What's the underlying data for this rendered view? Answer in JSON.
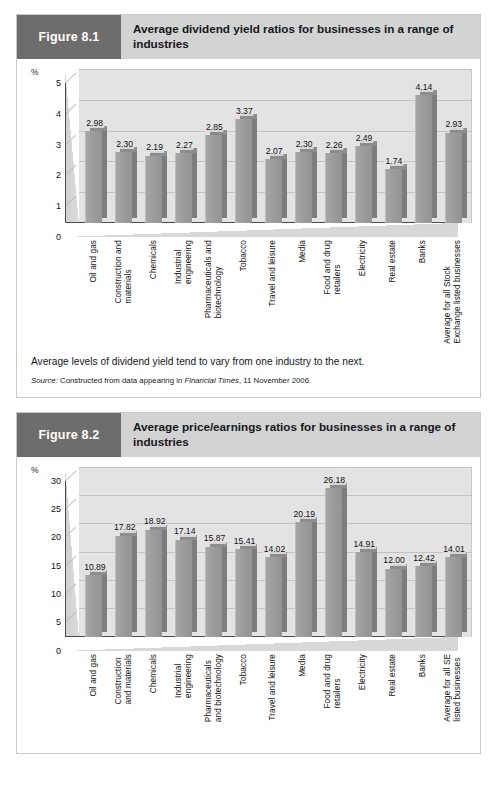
{
  "page": {
    "background": "#ffffff",
    "badge_color": "#6d6d6d",
    "header_color": "#d3d3d3",
    "bar_color": "#9a9a9a",
    "bar_side_color": "#7d7d7d",
    "plot_bg": "#e3e3e3"
  },
  "figures": [
    {
      "badge": "Figure 8.1",
      "title": "Average dividend yield ratios for businesses in a range of industries",
      "caption": "Average levels of dividend yield tend to vary from one industry to the next.",
      "source_prefix": "Source:",
      "source_text_1": " Constructed from data appearing in ",
      "source_italic": "Financial Times",
      "source_text_2": ", 11 November 2006.",
      "chart_data": {
        "type": "bar",
        "title": "Average dividend yield ratios for businesses in a range of industries",
        "xlabel": "",
        "ylabel": "%",
        "ylim": [
          0,
          5
        ],
        "yticks": [
          0,
          1,
          2,
          3,
          4,
          5
        ],
        "grid": true,
        "legend": "none",
        "categories": [
          "Oil and gas",
          "Construction and materials",
          "Chemicals",
          "Industrial engineering",
          "Pharmaceuticals and biotechnology",
          "Tobacco",
          "Travel and leisure",
          "Media",
          "Food and drug retailers",
          "Electricity",
          "Real estate",
          "Banks",
          "Average for all Stock Exchange listed businesses"
        ],
        "category_lines": [
          [
            "Oil and gas"
          ],
          [
            "Construction and",
            "materials"
          ],
          [
            "Chemicals"
          ],
          [
            "Industrial",
            "engineering"
          ],
          [
            "Pharmaceuticals and",
            "biotechnology"
          ],
          [
            "Tobacco"
          ],
          [
            "Travel and leisure"
          ],
          [
            "Media"
          ],
          [
            "Food and drug",
            "retailers"
          ],
          [
            "Electricity"
          ],
          [
            "Real estate"
          ],
          [
            "Banks"
          ],
          [
            "Average for all Stock",
            "Exchange listed businesses"
          ]
        ],
        "values": [
          2.98,
          2.3,
          2.19,
          2.27,
          2.85,
          3.37,
          2.07,
          2.3,
          2.26,
          2.49,
          1.74,
          4.14,
          2.93
        ],
        "value_labels": [
          "2.98",
          "2.30",
          "2.19",
          "2.27",
          "2.85",
          "3.37",
          "2.07",
          "2.30",
          "2.26",
          "2.49",
          "1.74",
          "4.14",
          "2.93"
        ]
      }
    },
    {
      "badge": "Figure 8.2",
      "title": "Average price/earnings ratios for businesses in a range of industries",
      "caption": "",
      "source_prefix": "",
      "source_text_1": "",
      "source_italic": "",
      "source_text_2": "",
      "chart_data": {
        "type": "bar",
        "title": "Average price/earnings ratios for businesses in a range of industries",
        "xlabel": "",
        "ylabel": "%",
        "ylim": [
          0,
          30
        ],
        "yticks": [
          0,
          5,
          10,
          15,
          20,
          25,
          30
        ],
        "grid": true,
        "legend": "none",
        "categories": [
          "Oil and gas",
          "Construction and materials",
          "Chemicals",
          "Industrial engineering",
          "Pharmaceuticals and biotechnology",
          "Tobacco",
          "Travel and leisure",
          "Media",
          "Food and drug retailers",
          "Electricity",
          "Real estate",
          "Banks",
          "Average for all SE listed businesses"
        ],
        "category_lines": [
          [
            "Oil and gas"
          ],
          [
            "Construction",
            "and  materials"
          ],
          [
            "Chemicals"
          ],
          [
            "Industrial",
            "engineering"
          ],
          [
            "Pharmaceuticals",
            "and biotechnology"
          ],
          [
            "Tobacco"
          ],
          [
            "Travel and leisure"
          ],
          [
            "Media"
          ],
          [
            "Food and drug",
            "retailers"
          ],
          [
            "Electricity"
          ],
          [
            "Real estate"
          ],
          [
            "Banks"
          ],
          [
            "Average for all SE",
            "listed businesses"
          ]
        ],
        "values": [
          10.89,
          17.82,
          18.92,
          17.14,
          15.87,
          15.41,
          14.02,
          20.19,
          26.18,
          14.91,
          12.0,
          12.42,
          14.01
        ],
        "value_labels": [
          "10.89",
          "17.82",
          "18.92",
          "17.14",
          "15.87",
          "15.41",
          "14.02",
          "20.19",
          "26.18",
          "14.91",
          "12.00",
          "12.42",
          "14.01"
        ]
      }
    }
  ]
}
